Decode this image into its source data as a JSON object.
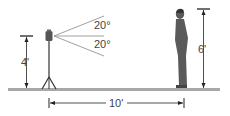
{
  "diagram": {
    "type": "geometry-illustration",
    "labels": {
      "angle_upper": "20°",
      "angle_lower": "20°",
      "camera_height": "4'",
      "person_height": "6'",
      "distance": "10'"
    },
    "colors": {
      "ground": "#9a9a9a",
      "lines": "#333333",
      "person": "#555555",
      "text": "#444444"
    }
  }
}
